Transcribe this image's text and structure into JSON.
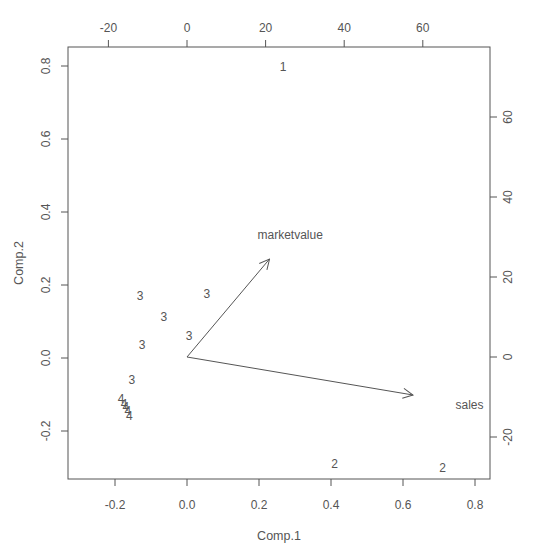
{
  "chart_data": {
    "type": "scatter",
    "subtype": "biplot",
    "title": "",
    "xlabel": "Comp.1",
    "ylabel": "Comp.2",
    "xlim": [
      -0.33,
      0.85
    ],
    "ylim": [
      -0.33,
      0.85
    ],
    "x_ticks": [
      -0.2,
      0.0,
      0.2,
      0.4,
      0.6,
      0.8
    ],
    "x_tick_labels": [
      "-0.2",
      "0.0",
      "0.2",
      "0.4",
      "0.6",
      "0.8"
    ],
    "y_ticks": [
      -0.2,
      0.0,
      0.2,
      0.4,
      0.6,
      0.8
    ],
    "y_tick_labels": [
      "-0.2",
      "0.0",
      "0.2",
      "0.4",
      "0.6",
      "0.8"
    ],
    "top_ticks": [
      -20,
      0,
      20,
      40,
      60
    ],
    "top_tick_labels": [
      "-20",
      "0",
      "20",
      "40",
      "60"
    ],
    "right_ticks": [
      -20,
      0,
      20,
      40,
      60
    ],
    "right_tick_labels": [
      "-20",
      "0",
      "20",
      "40",
      "60"
    ],
    "grid": false,
    "legend": null,
    "points": [
      {
        "label": "1",
        "x": 0.267,
        "y": 0.8
      },
      {
        "label": "2",
        "x": 0.41,
        "y": -0.29
      },
      {
        "label": "2",
        "x": 0.71,
        "y": -0.3
      },
      {
        "label": "3",
        "x": -0.13,
        "y": 0.17
      },
      {
        "label": "3",
        "x": 0.055,
        "y": 0.178
      },
      {
        "label": "3",
        "x": -0.064,
        "y": 0.115
      },
      {
        "label": "3",
        "x": 0.006,
        "y": 0.063
      },
      {
        "label": "3",
        "x": -0.125,
        "y": 0.038
      },
      {
        "label": "3",
        "x": -0.153,
        "y": -0.06
      },
      {
        "label": "4",
        "x": -0.183,
        "y": -0.11
      },
      {
        "label": "4",
        "x": -0.175,
        "y": -0.125
      },
      {
        "label": "4",
        "x": -0.17,
        "y": -0.132
      },
      {
        "label": "4",
        "x": -0.164,
        "y": -0.145
      },
      {
        "label": "4",
        "x": -0.16,
        "y": -0.157
      }
    ],
    "loadings": [
      {
        "name": "marketvalue",
        "x": 21,
        "y": 24.5
      },
      {
        "name": "sales",
        "x": 57.5,
        "y": -9.5
      }
    ]
  },
  "colors": {
    "ink": "#555555",
    "background": "#ffffff"
  }
}
